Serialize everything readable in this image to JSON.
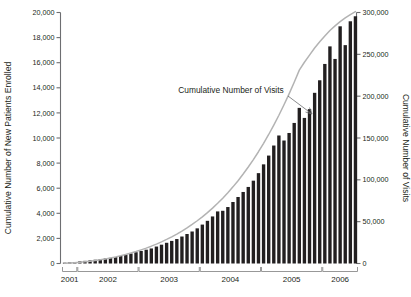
{
  "chart_data": {
    "type": "bar",
    "title": "",
    "subtitle": "",
    "xlabel": "",
    "ylabel": "Cumulative Number of New Patients Enrolled",
    "y2label": "Cumulative Number of Visits",
    "ylim": [
      0,
      20000
    ],
    "y2lim": [
      0,
      300000
    ],
    "grid": false,
    "legend_position": "none",
    "annotations": [
      {
        "text": "Cumulative Number of Visits",
        "points_to": "line-series",
        "x": 231,
        "y": 93
      }
    ],
    "yticks": [
      0,
      2000,
      4000,
      6000,
      8000,
      10000,
      12000,
      14000,
      16000,
      18000,
      20000
    ],
    "ytick_labels": [
      "0",
      "2,000",
      "4,000",
      "6,000",
      "8,000",
      "10,000",
      "12,000",
      "14,000",
      "16,000",
      "18,000",
      "20,000"
    ],
    "y2ticks": [
      0,
      50000,
      100000,
      150000,
      200000,
      250000,
      300000
    ],
    "y2tick_labels": [
      "0",
      "50,000",
      "100,000",
      "150,000",
      "200,000",
      "250,000",
      "300,000"
    ],
    "year_groups": [
      {
        "label": "2001",
        "start_index": 0,
        "end_index": 2
      },
      {
        "label": "2002",
        "start_index": 3,
        "end_index": 14
      },
      {
        "label": "2003",
        "start_index": 15,
        "end_index": 26
      },
      {
        "label": "2004",
        "start_index": 27,
        "end_index": 38
      },
      {
        "label": "2005",
        "start_index": 39,
        "end_index": 50
      },
      {
        "label": "2006",
        "start_index": 51,
        "end_index": 57
      }
    ],
    "categories": [
      "2001-10",
      "2001-11",
      "2001-12",
      "2002-01",
      "2002-02",
      "2002-03",
      "2002-04",
      "2002-05",
      "2002-06",
      "2002-07",
      "2002-08",
      "2002-09",
      "2002-10",
      "2002-11",
      "2002-12",
      "2003-01",
      "2003-02",
      "2003-03",
      "2003-04",
      "2003-05",
      "2003-06",
      "2003-07",
      "2003-08",
      "2003-09",
      "2003-10",
      "2003-11",
      "2003-12",
      "2004-01",
      "2004-02",
      "2004-03",
      "2004-04",
      "2004-05",
      "2004-06",
      "2004-07",
      "2004-08",
      "2004-09",
      "2004-10",
      "2004-11",
      "2004-12",
      "2005-01",
      "2005-02",
      "2005-03",
      "2005-04",
      "2005-05",
      "2005-06",
      "2005-07",
      "2005-08",
      "2005-09",
      "2005-10",
      "2005-11",
      "2005-12",
      "2006-01",
      "2006-02",
      "2006-03",
      "2006-04",
      "2006-05",
      "2006-06",
      "2006-07"
    ],
    "series": [
      {
        "name": "Cumulative Number of New Patients Enrolled",
        "type": "bar",
        "axis": "left",
        "color": "#221f20",
        "values": [
          60,
          90,
          120,
          170,
          210,
          250,
          300,
          350,
          400,
          450,
          520,
          600,
          700,
          800,
          900,
          1000,
          1100,
          1200,
          1350,
          1500,
          1650,
          1800,
          1950,
          2150,
          2350,
          2550,
          2800,
          3100,
          3400,
          3750,
          4150,
          4200,
          4500,
          4900,
          5300,
          5700,
          6100,
          6600,
          7200,
          7900,
          8600,
          9400,
          10200,
          9800,
          10400,
          11200,
          12400,
          11600,
          12300,
          13600,
          14600,
          15900,
          17300,
          16300,
          18900,
          17400,
          19300,
          19700
        ]
      },
      {
        "name": "Cumulative Number of Visits",
        "type": "line",
        "axis": "right",
        "color": "#b3b3b3",
        "values": [
          300,
          600,
          1000,
          1500,
          2100,
          2800,
          3600,
          4500,
          5500,
          6600,
          7800,
          9200,
          10800,
          12500,
          14300,
          16300,
          18400,
          20700,
          23200,
          25900,
          28800,
          31900,
          35200,
          38800,
          42600,
          46700,
          51100,
          55800,
          60800,
          66200,
          72000,
          78100,
          84600,
          91600,
          99000,
          106900,
          115300,
          124200,
          133600,
          143600,
          154200,
          165400,
          177200,
          189700,
          202800,
          216600,
          231100,
          240500,
          249000,
          257500,
          265000,
          272000,
          278500,
          284000,
          289000,
          293500,
          297500,
          301000
        ]
      }
    ]
  }
}
